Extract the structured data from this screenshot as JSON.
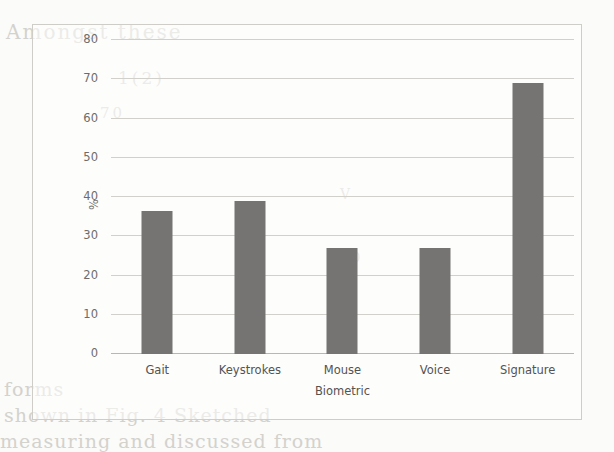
{
  "chart_data": {
    "type": "bar",
    "title": "",
    "subtitle": "",
    "xlabel": "Biometric",
    "ylabel": "%",
    "categories": [
      "Gait",
      "Keystrokes",
      "Mouse",
      "Voice",
      "Signature"
    ],
    "values": [
      36.5,
      39,
      27,
      27,
      69
    ],
    "ylim": [
      0,
      80
    ],
    "ytick_labels": [
      "80",
      "70",
      "60",
      "50",
      "40",
      "30",
      "20",
      "10",
      "0"
    ],
    "ytick_values": [
      80,
      70,
      60,
      50,
      40,
      30,
      20,
      10,
      0
    ],
    "ystep": 10,
    "grid": "horizontal",
    "legend": "none",
    "bar_color": "#757472",
    "gridline_color": "#d2d0cb",
    "axis_text_color": "#55534f",
    "plot_background": "#ffffff",
    "border_color": "#cfcdc8"
  },
  "background_artifacts": {
    "note": "faint reverse-side print bleeding through the scanned page",
    "lines": [
      "Amongst these",
      "1(2)",
      "70",
      "forms",
      "shown in Fig. 4 Sketched",
      "measuring and discussed from",
      "V",
      "0",
      "(2)"
    ]
  }
}
